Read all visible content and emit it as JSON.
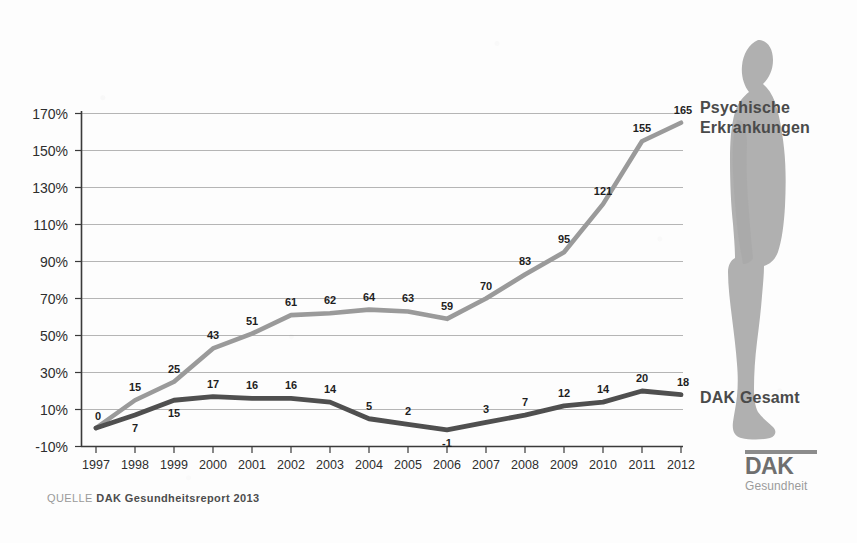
{
  "chart_data": {
    "type": "line",
    "title": "",
    "xlabel": "",
    "ylabel": "",
    "categories": [
      "1997",
      "1998",
      "1999",
      "2000",
      "2001",
      "2002",
      "2003",
      "2004",
      "2005",
      "2006",
      "2007",
      "2008",
      "2009",
      "2010",
      "2011",
      "2012"
    ],
    "ytick_labels": [
      "170%",
      "150%",
      "130%",
      "110%",
      "90%",
      "70%",
      "50%",
      "30%",
      "10%",
      "-10%"
    ],
    "ytick_values": [
      170,
      150,
      130,
      110,
      90,
      70,
      50,
      30,
      10,
      -10
    ],
    "ylim": [
      -10,
      175
    ],
    "grid": true,
    "legend_position": "right-inline",
    "series": [
      {
        "name": "Psychische Erkrankungen",
        "color": "#9a9a9a",
        "values": [
          0,
          15,
          25,
          43,
          51,
          61,
          62,
          64,
          63,
          59,
          70,
          83,
          95,
          121,
          155,
          165
        ],
        "labels": [
          "0",
          "15",
          "25",
          "43",
          "51",
          "61",
          "62",
          "64",
          "63",
          "59",
          "70",
          "83",
          "95",
          "121",
          "155",
          "165"
        ]
      },
      {
        "name": "DAK Gesamt",
        "color": "#4f4f4f",
        "values": [
          0,
          7,
          15,
          17,
          16,
          16,
          14,
          5,
          2,
          -1,
          3,
          7,
          12,
          14,
          20,
          18
        ],
        "labels": [
          "0",
          "7",
          "15",
          "17",
          "16",
          "16",
          "14",
          "5",
          "2",
          "-1",
          "3",
          "7",
          "12",
          "14",
          "20",
          "18"
        ]
      }
    ]
  },
  "labels": {
    "series_psychische": "Psychische\nErkrankungen",
    "series_gesamt": "DAK Gesamt"
  },
  "source": {
    "key": "QUELLE",
    "value": "DAK Gesundheitsreport 2013"
  },
  "logo": {
    "word": "DAK",
    "sub": "Gesundheit"
  },
  "colors": {
    "line_psychische": "#9a9a9a",
    "line_gesamt": "#4f4f4f",
    "grid": "#b5b5b5",
    "axis": "#3a3a3a",
    "silhouette": "#b0b0b0",
    "background": "#fdfdfd"
  }
}
